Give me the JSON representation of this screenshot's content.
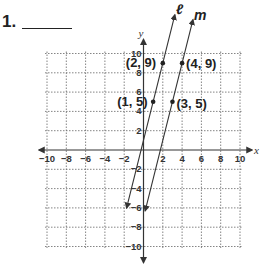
{
  "problem": {
    "number": "1.",
    "answer_blank": ""
  },
  "chart_data": {
    "type": "line",
    "title": "",
    "xlabel": "x",
    "ylabel": "y",
    "xlim": [
      -10,
      10
    ],
    "ylim": [
      -10,
      10
    ],
    "grid": true,
    "x_ticks": [
      -10,
      -8,
      -6,
      -4,
      -2,
      2,
      4,
      6,
      8,
      10
    ],
    "y_ticks": [
      10,
      8,
      6,
      4,
      2,
      -2,
      -4,
      -6,
      -8,
      -10
    ],
    "series": [
      {
        "name": "ℓ",
        "equation": "y = 4x + 1",
        "points": [
          [
            1,
            5
          ],
          [
            2,
            9
          ]
        ],
        "labels": [
          "(1, 5)",
          "(2, 9)"
        ]
      },
      {
        "name": "m",
        "equation": "y = 4x - 7",
        "points": [
          [
            3,
            5
          ],
          [
            4,
            9
          ]
        ],
        "labels": [
          "(3, 5)",
          "(4, 9)"
        ]
      }
    ]
  },
  "labels": {
    "x_axis": "x",
    "y_axis": "y",
    "line_l": "ℓ",
    "line_m": "m",
    "pt_l1": "(1, 5)",
    "pt_l2": "(2, 9)",
    "pt_m1": "(3, 5)",
    "pt_m2": "(4, 9)",
    "ticks_x": [
      "−10",
      "−8",
      "−6",
      "−4",
      "−2",
      "2",
      "4",
      "6",
      "8",
      "10"
    ],
    "ticks_y": [
      "10",
      "8",
      "6",
      "4",
      "2",
      "−2",
      "−4",
      "−6",
      "−8",
      "−10"
    ]
  }
}
